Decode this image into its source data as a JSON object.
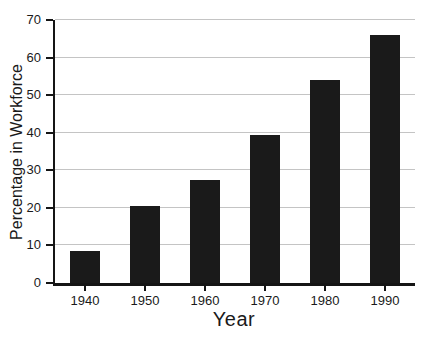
{
  "chart_data": {
    "type": "bar",
    "categories": [
      "1940",
      "1950",
      "1960",
      "1970",
      "1980",
      "1990"
    ],
    "values": [
      8.5,
      20.5,
      27.5,
      39.5,
      54,
      66
    ],
    "title": "",
    "xlabel": "Year",
    "ylabel": "Percentage in Workforce",
    "ylim": [
      0,
      70
    ],
    "yticks": [
      0,
      10,
      20,
      30,
      40,
      50,
      60,
      70
    ],
    "grid": true,
    "legend": "none",
    "bar_color": "#1a1a1a",
    "grid_color": "#c4c4c4",
    "axis_color": "#151515",
    "text_color": "#1a1a1a",
    "background_color": "#ffffff"
  }
}
